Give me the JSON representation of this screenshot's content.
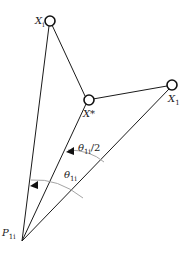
{
  "diagram": {
    "colors": {
      "line": "#1a1a1a",
      "arc": "#9a9a9a",
      "background": "#ffffff"
    },
    "nodes": {
      "xi": {
        "label": "X",
        "sub": "i"
      },
      "xstar": {
        "label": "X*",
        "sub": ""
      },
      "x1": {
        "label": "X",
        "sub": "1"
      },
      "p": {
        "label": "P",
        "sub": "1i"
      }
    },
    "angles": {
      "theta_full": {
        "label": "θ",
        "sub": "1i",
        "suffix": ""
      },
      "theta_half": {
        "label": "θ",
        "sub": "1i",
        "suffix": "/2"
      }
    }
  }
}
